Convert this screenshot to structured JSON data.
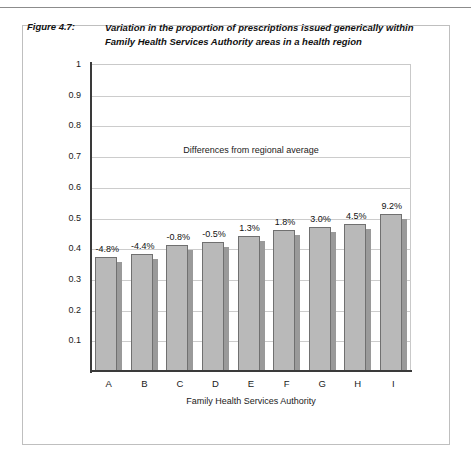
{
  "page": {
    "folio": ""
  },
  "figure": {
    "number": "Figure 4.7:",
    "caption": "Variation in the proportion of prescriptions issued generically within Family Health Services Authority areas in a health region"
  },
  "chart_data": {
    "type": "bar",
    "title": "Variation in the proportion of prescriptions issued generically within Family Health Services Authority areas in a health region",
    "categories": [
      "A",
      "B",
      "C",
      "D",
      "E",
      "F",
      "G",
      "H",
      "I"
    ],
    "values": [
      0.37,
      0.38,
      0.41,
      0.42,
      0.44,
      0.46,
      0.47,
      0.48,
      0.51
    ],
    "data_labels": [
      "-4.8%",
      "-4.4%",
      "-0.8%",
      "-0.5%",
      "1.3%",
      "1.8%",
      "3.0%",
      "4.5%",
      "9.2%"
    ],
    "xlabel": "Family Health Services Authority",
    "ylabel": "Proportion of prescriptions issued generically",
    "ylim": [
      0,
      1
    ],
    "ytick_labels": [
      "1",
      "0.9",
      "0.8",
      "0.7",
      "0.6",
      "0.5",
      "0.4",
      "0.3",
      "0.2",
      "0.1"
    ],
    "ytick_values": [
      1,
      0.9,
      0.8,
      0.7,
      0.6,
      0.5,
      0.4,
      0.3,
      0.2,
      0.1
    ],
    "grid": true,
    "legend": "none",
    "annotations": [
      {
        "text": "Differences from regional average",
        "x": 0.5,
        "y": 0.72
      }
    ],
    "colors": {
      "bar_fill": "#b9b9b9",
      "bar_border": "#707070",
      "bar_shadow": "#9a9a9a",
      "gridline": "#cccccc",
      "axis": "#3a3a3a",
      "frame": "#bfbfbf",
      "text": "#111111"
    }
  }
}
